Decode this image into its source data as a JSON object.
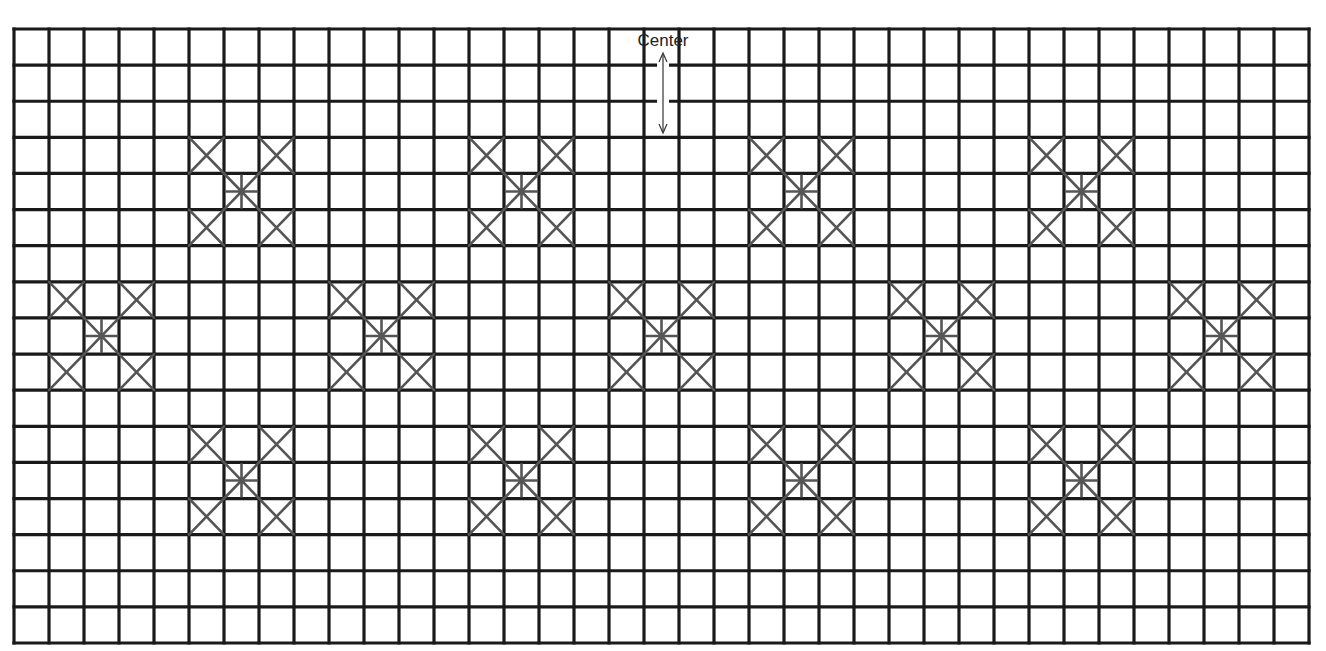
{
  "diagram": {
    "type": "cross-stitch-grid-chart",
    "grid": {
      "columns": 37,
      "rows": 17,
      "left": 14,
      "top": 29,
      "right": 1309,
      "bottom": 643,
      "line_color": "#1a1a1a",
      "line_width": 3.2,
      "background": "#ffffff"
    },
    "motif": {
      "description": "3x3 cell motif: diagonal cross (X) in each corner cell, eight-point star in center cell",
      "stroke_color": "#555555",
      "stroke_width": 2.6,
      "corner_offsets": [
        [
          -1,
          -1
        ],
        [
          1,
          -1
        ],
        [
          -1,
          1
        ],
        [
          1,
          1
        ]
      ]
    },
    "motif_centers": [
      {
        "col": 6,
        "row": 4
      },
      {
        "col": 14,
        "row": 4
      },
      {
        "col": 22,
        "row": 4
      },
      {
        "col": 30,
        "row": 4
      },
      {
        "col": 2,
        "row": 8
      },
      {
        "col": 10,
        "row": 8
      },
      {
        "col": 18,
        "row": 8
      },
      {
        "col": 26,
        "row": 8
      },
      {
        "col": 34,
        "row": 8
      },
      {
        "col": 6,
        "row": 12
      },
      {
        "col": 14,
        "row": 12
      },
      {
        "col": 22,
        "row": 12
      },
      {
        "col": 30,
        "row": 12
      }
    ],
    "center_marker": {
      "label": "Center",
      "label_x": 663,
      "label_y": 32,
      "arrow_x": 663,
      "arrow_y1": 53,
      "arrow_y2": 133,
      "arrow_color": "#333333",
      "arrow_style": "double-headed"
    }
  }
}
